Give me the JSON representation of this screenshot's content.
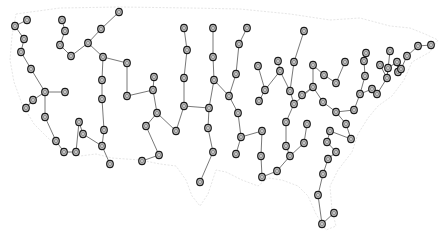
{
  "diagram": {
    "type": "network-graph-over-map",
    "colors": {
      "background": "#ffffff",
      "map_outline": "#e6e6e6",
      "edge": "#555555",
      "node_fill": "#cfcfcf",
      "node_stroke": "#1a1a1a"
    },
    "node_radius": 3.3,
    "nodes": [
      [
        15,
        26
      ],
      [
        27,
        20
      ],
      [
        24,
        39
      ],
      [
        21,
        52
      ],
      [
        31,
        69
      ],
      [
        45,
        92
      ],
      [
        65,
        92
      ],
      [
        33,
        100
      ],
      [
        26,
        108
      ],
      [
        45,
        117
      ],
      [
        56,
        141
      ],
      [
        64,
        152
      ],
      [
        76,
        152
      ],
      [
        79,
        122
      ],
      [
        83,
        134
      ],
      [
        102,
        146
      ],
      [
        110,
        164
      ],
      [
        104,
        130
      ],
      [
        102,
        99
      ],
      [
        102,
        80
      ],
      [
        103,
        57
      ],
      [
        127,
        63
      ],
      [
        127,
        96
      ],
      [
        88,
        43
      ],
      [
        101,
        29
      ],
      [
        119,
        12
      ],
      [
        62,
        20
      ],
      [
        65,
        31
      ],
      [
        60,
        45
      ],
      [
        71,
        56
      ],
      [
        153,
        90
      ],
      [
        154,
        77
      ],
      [
        157,
        113
      ],
      [
        146,
        126
      ],
      [
        159,
        155
      ],
      [
        142,
        161
      ],
      [
        176,
        131
      ],
      [
        184,
        106
      ],
      [
        187,
        50
      ],
      [
        184,
        28
      ],
      [
        184,
        78
      ],
      [
        209,
        108
      ],
      [
        208,
        128
      ],
      [
        213,
        152
      ],
      [
        200,
        182
      ],
      [
        213,
        28
      ],
      [
        213,
        57
      ],
      [
        214,
        80
      ],
      [
        229,
        96
      ],
      [
        238,
        113
      ],
      [
        241,
        137
      ],
      [
        236,
        154
      ],
      [
        262,
        131
      ],
      [
        261,
        156
      ],
      [
        262,
        177
      ],
      [
        277,
        171
      ],
      [
        247,
        28
      ],
      [
        239,
        44
      ],
      [
        236,
        74
      ],
      [
        258,
        66
      ],
      [
        278,
        61
      ],
      [
        280,
        71
      ],
      [
        265,
        90
      ],
      [
        259,
        101
      ],
      [
        290,
        91
      ],
      [
        294,
        62
      ],
      [
        304,
        31
      ],
      [
        294,
        104
      ],
      [
        286,
        122
      ],
      [
        286,
        146
      ],
      [
        290,
        156
      ],
      [
        304,
        143
      ],
      [
        307,
        124
      ],
      [
        313,
        65
      ],
      [
        324,
        75
      ],
      [
        336,
        83
      ],
      [
        345,
        62
      ],
      [
        313,
        87
      ],
      [
        302,
        95
      ],
      [
        323,
        102
      ],
      [
        336,
        112
      ],
      [
        346,
        124
      ],
      [
        351,
        139
      ],
      [
        330,
        131
      ],
      [
        327,
        142
      ],
      [
        336,
        152
      ],
      [
        328,
        159
      ],
      [
        323,
        174
      ],
      [
        318,
        195
      ],
      [
        322,
        224
      ],
      [
        334,
        213
      ],
      [
        354,
        110
      ],
      [
        360,
        94
      ],
      [
        366,
        53
      ],
      [
        364,
        61
      ],
      [
        365,
        76
      ],
      [
        372,
        89
      ],
      [
        377,
        94
      ],
      [
        380,
        65
      ],
      [
        387,
        78
      ],
      [
        388,
        68
      ],
      [
        390,
        51
      ],
      [
        397,
        62
      ],
      [
        398,
        72
      ],
      [
        401,
        69
      ],
      [
        407,
        56
      ],
      [
        418,
        46
      ],
      [
        431,
        45
      ]
    ],
    "edges": [
      [
        0,
        1
      ],
      [
        0,
        2
      ],
      [
        2,
        3
      ],
      [
        3,
        4
      ],
      [
        4,
        5
      ],
      [
        5,
        6
      ],
      [
        5,
        7
      ],
      [
        7,
        8
      ],
      [
        5,
        9
      ],
      [
        9,
        10
      ],
      [
        10,
        11
      ],
      [
        11,
        12
      ],
      [
        12,
        13
      ],
      [
        13,
        14
      ],
      [
        14,
        15
      ],
      [
        15,
        16
      ],
      [
        15,
        17
      ],
      [
        17,
        18
      ],
      [
        18,
        19
      ],
      [
        19,
        20
      ],
      [
        20,
        21
      ],
      [
        21,
        22
      ],
      [
        20,
        23
      ],
      [
        23,
        24
      ],
      [
        24,
        25
      ],
      [
        23,
        29
      ],
      [
        29,
        28
      ],
      [
        28,
        27
      ],
      [
        27,
        26
      ],
      [
        22,
        30
      ],
      [
        30,
        31
      ],
      [
        30,
        32
      ],
      [
        32,
        33
      ],
      [
        33,
        34
      ],
      [
        34,
        35
      ],
      [
        32,
        36
      ],
      [
        36,
        37
      ],
      [
        37,
        40
      ],
      [
        40,
        38
      ],
      [
        38,
        39
      ],
      [
        37,
        41
      ],
      [
        41,
        42
      ],
      [
        42,
        43
      ],
      [
        43,
        44
      ],
      [
        41,
        47
      ],
      [
        47,
        46
      ],
      [
        46,
        45
      ],
      [
        47,
        48
      ],
      [
        48,
        49
      ],
      [
        49,
        50
      ],
      [
        50,
        51
      ],
      [
        50,
        52
      ],
      [
        52,
        53
      ],
      [
        53,
        54
      ],
      [
        54,
        55
      ],
      [
        55,
        70
      ],
      [
        48,
        58
      ],
      [
        58,
        57
      ],
      [
        57,
        56
      ],
      [
        59,
        62
      ],
      [
        62,
        61
      ],
      [
        61,
        60
      ],
      [
        62,
        63
      ],
      [
        61,
        64
      ],
      [
        64,
        65
      ],
      [
        65,
        66
      ],
      [
        64,
        67
      ],
      [
        67,
        68
      ],
      [
        68,
        69
      ],
      [
        69,
        70
      ],
      [
        70,
        71
      ],
      [
        71,
        72
      ],
      [
        67,
        77
      ],
      [
        77,
        78
      ],
      [
        77,
        73
      ],
      [
        73,
        74
      ],
      [
        74,
        75
      ],
      [
        75,
        76
      ],
      [
        77,
        79
      ],
      [
        79,
        80
      ],
      [
        80,
        81
      ],
      [
        81,
        82
      ],
      [
        80,
        91
      ],
      [
        91,
        92
      ],
      [
        92,
        95
      ],
      [
        95,
        94
      ],
      [
        94,
        93
      ],
      [
        92,
        96
      ],
      [
        96,
        97
      ],
      [
        97,
        99
      ],
      [
        99,
        98
      ],
      [
        99,
        101
      ],
      [
        99,
        100
      ],
      [
        100,
        102
      ],
      [
        102,
        103
      ],
      [
        103,
        104
      ],
      [
        104,
        105
      ],
      [
        105,
        106
      ],
      [
        106,
        107
      ],
      [
        82,
        83
      ],
      [
        83,
        84
      ],
      [
        84,
        85
      ],
      [
        85,
        86
      ],
      [
        86,
        87
      ],
      [
        87,
        88
      ],
      [
        88,
        89
      ],
      [
        89,
        90
      ]
    ],
    "map_outline_path": "M16,14 L60,8 L120,7 L190,8 L240,9 L290,14 L330,20 L360,18 L390,26 L410,28 L425,34 L438,40 L430,52 L412,62 L404,80 L392,96 L378,106 L368,118 L358,134 L352,152 L338,170 L330,186 L332,210 L336,226 L326,230 L316,214 L308,196 L298,186 L282,180 L268,178 L258,186 L242,180 L226,172 L216,170 L208,194 L200,206 L192,196 L186,180 L176,166 L160,164 L140,160 L112,158 L96,154 L80,156 L62,150 L48,138 L34,124 L22,104 L14,82 L10,60 L12,36 Z"
  }
}
